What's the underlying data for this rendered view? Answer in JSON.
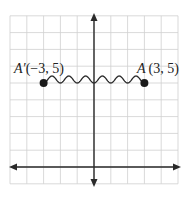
{
  "diagram": {
    "type": "coordinate-grid-translation",
    "grid": {
      "x_min": -5,
      "x_max": 5,
      "y_min": -1,
      "y_max": 9,
      "step": 1,
      "grid_color": "#cfcfcf",
      "axis_color": "#2a2a2a"
    },
    "points": [
      {
        "id": "A_prime",
        "name": "A′",
        "x": -3,
        "y": 5,
        "label_name": "A′",
        "label_coords": "(−3, 5)"
      },
      {
        "id": "A",
        "name": "A",
        "x": 3,
        "y": 5,
        "label_name": "A",
        "label_coords": "(3, 5)"
      }
    ],
    "connector": {
      "type": "wavy-line",
      "from": "A_prime",
      "to": "A",
      "periods": 6
    }
  }
}
